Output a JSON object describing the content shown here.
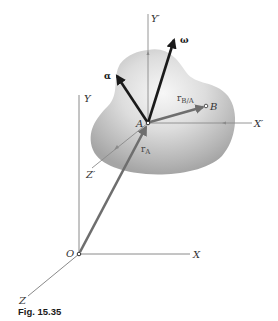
{
  "figure": {
    "caption": "Fig. 15.35",
    "colors": {
      "axis": "#8a8a8a",
      "dark_vector": "#1a1a1a",
      "gray_vector": "#6e6e6e",
      "body_light": "#f4f4f4",
      "body_dark": "#a9a9a9"
    }
  },
  "fixed_axes": {
    "origin_label": "O",
    "x_label": "X",
    "y_label": "Y",
    "z_label": "Z"
  },
  "moving_axes": {
    "origin_label": "A",
    "x_label": "X′",
    "y_label": "Y′",
    "z_label": "Z′"
  },
  "vectors": {
    "omega_label": "ω",
    "alpha_label": "α",
    "r_A_main": "r",
    "r_A_sub": "A",
    "r_BA_main": "r",
    "r_BA_sub": "B/A"
  },
  "points": {
    "B_label": "B"
  }
}
